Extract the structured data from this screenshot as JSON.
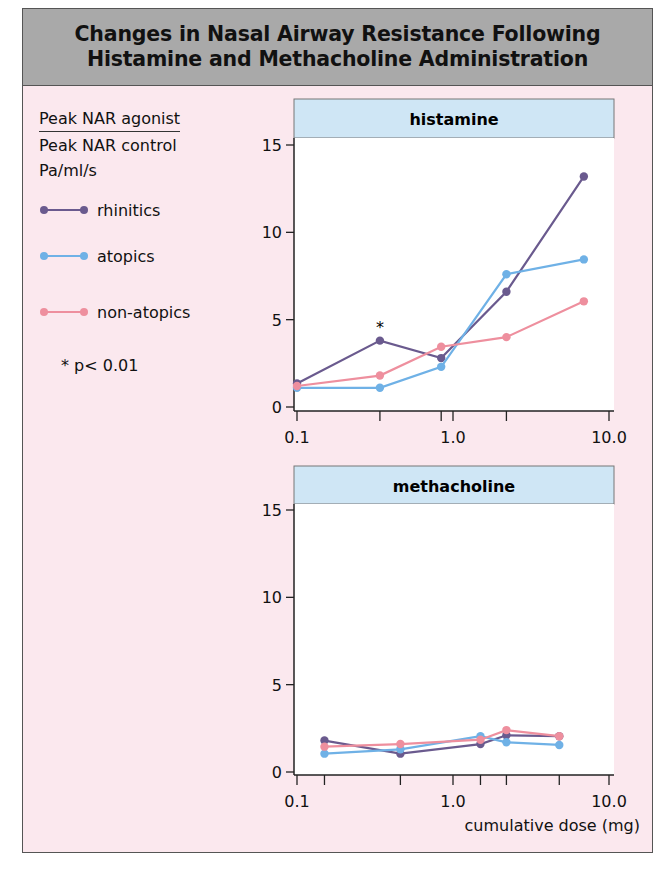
{
  "title": {
    "line1": "Changes in Nasal Airway Resistance Following",
    "line2": "Histamine and Methacholine Administration"
  },
  "legend": {
    "ylabel_numerator": "Peak NAR agonist",
    "ylabel_denominator": "Peak NAR control",
    "ylabel_unit": "Pa/ml/s",
    "items": [
      {
        "label": "rhinitics",
        "color": "#6a5a8e"
      },
      {
        "label": "atopics",
        "color": "#6fb1e6"
      },
      {
        "label": "non-atopics",
        "color": "#ee8f9e"
      }
    ],
    "significance_note": "* p< 0.01"
  },
  "colors": {
    "frame_bg": "#fbe8ee",
    "header_bg": "#a9a9a9",
    "panel_label_bg": "#cfe6f5",
    "plot_bg": "#ffffff",
    "rhinitics": "#6a5a8e",
    "atopics": "#6fb1e6",
    "non_atopics": "#ee8f9e"
  },
  "chart_data": [
    {
      "type": "line",
      "title": "histamine",
      "xlabel": "",
      "ylabel": "Peak NAR agonist / Peak NAR control (Pa/ml/s)",
      "xscale": "log",
      "xlim": [
        0.1,
        10.0
      ],
      "ylim": [
        0,
        15
      ],
      "x_tick_labels": [
        "0.1",
        "1.0",
        "10.0"
      ],
      "y_tick_labels": [
        "0",
        "5",
        "10",
        "15"
      ],
      "x_minor_ticks": [
        0.34,
        0.84,
        2.2
      ],
      "grid": false,
      "x": [
        0.1,
        0.34,
        0.84,
        2.2,
        6.9
      ],
      "series": [
        {
          "name": "rhinitics",
          "values": [
            1.35,
            3.8,
            2.8,
            6.6,
            13.2
          ]
        },
        {
          "name": "atopics",
          "values": [
            1.1,
            1.1,
            2.3,
            7.6,
            8.45
          ]
        },
        {
          "name": "non-atopics",
          "values": [
            1.2,
            1.8,
            3.45,
            4.0,
            6.05
          ]
        }
      ],
      "annotations": [
        {
          "text": "*",
          "x": 0.34,
          "y": 4.6,
          "series": "rhinitics"
        }
      ]
    },
    {
      "type": "line",
      "title": "methacholine",
      "xlabel": "cumulative dose (mg)",
      "ylabel": "Peak NAR agonist / Peak NAR control (Pa/ml/s)",
      "xscale": "log",
      "xlim": [
        0.1,
        10.0
      ],
      "ylim": [
        0,
        15
      ],
      "x_tick_labels": [
        "0.1",
        "1.0",
        "10.0"
      ],
      "y_tick_labels": [
        "0",
        "5",
        "10",
        "15"
      ],
      "x_minor_ticks": [
        0.15,
        0.46,
        1.5,
        2.2,
        4.8
      ],
      "grid": false,
      "x": [
        0.15,
        0.46,
        1.5,
        2.2,
        4.8
      ],
      "series": [
        {
          "name": "rhinitics",
          "values": [
            1.8,
            1.05,
            1.6,
            2.1,
            2.05
          ]
        },
        {
          "name": "atopics",
          "values": [
            1.05,
            1.3,
            2.05,
            1.7,
            1.55
          ]
        },
        {
          "name": "non-atopics",
          "values": [
            1.45,
            1.6,
            1.85,
            2.4,
            2.05
          ]
        }
      ],
      "annotations": []
    }
  ]
}
